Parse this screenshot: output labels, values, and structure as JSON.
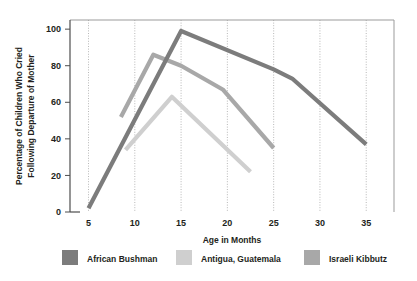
{
  "chart_data": {
    "type": "line",
    "title": "",
    "xlabel": "Age in Months",
    "ylabel": "Percentage of Children Who Cried Following Departure of Mother",
    "ylabel_line1": "Percentage of Children Who Cried",
    "ylabel_line2": "Following Departure of Mother",
    "xlim": [
      3,
      38
    ],
    "ylim": [
      0,
      105
    ],
    "xticks": [
      5,
      10,
      15,
      20,
      25,
      30,
      35
    ],
    "xtick_labels": [
      "5",
      "10",
      "15",
      "20",
      "25",
      "30",
      "35"
    ],
    "yticks": [
      0,
      20,
      40,
      60,
      80,
      100
    ],
    "ytick_labels": [
      "0",
      "20",
      "40",
      "60",
      "80",
      "100"
    ],
    "grid": "vertical-dotted",
    "legend_position": "bottom",
    "series": [
      {
        "name": "African Bushman",
        "color": "#7c7c7c",
        "x": [
          5,
          15,
          25,
          27,
          35
        ],
        "values": [
          2,
          99,
          78,
          73,
          37
        ]
      },
      {
        "name": "Antigua, Guatemala",
        "color": "#cfcfcf",
        "x": [
          9,
          14,
          22.5
        ],
        "values": [
          34,
          63,
          22
        ]
      },
      {
        "name": "Israeli Kibbutz",
        "color": "#a8a8a8",
        "x": [
          8.5,
          12,
          15,
          19.5,
          25
        ],
        "values": [
          52,
          86,
          80,
          67,
          35
        ]
      }
    ]
  },
  "legend": {
    "items": [
      {
        "label": "African Bushman",
        "color": "#7c7c7c"
      },
      {
        "label": "Antigua, Guatemala",
        "color": "#cfcfcf"
      },
      {
        "label": "Israeli Kibbutz",
        "color": "#a8a8a8"
      }
    ]
  },
  "colors": {
    "background": "#ffffff",
    "text": "#231f20",
    "grid": "#9a9a9a",
    "frame": "#9b9b9b"
  }
}
